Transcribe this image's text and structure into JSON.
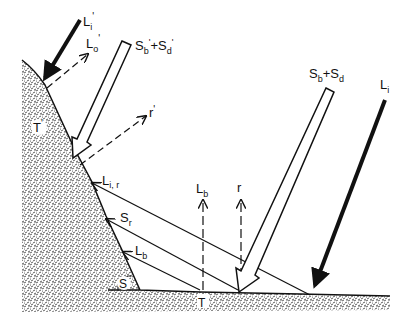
{
  "diagram": {
    "type": "radiation-balance-slope",
    "colors": {
      "ink": "#111111",
      "background": "#ffffff",
      "stipple": "#555555"
    },
    "labels": {
      "Li_prime": {
        "base": "L",
        "sub": "i",
        "prime": "'"
      },
      "Lo_prime": {
        "base": "L",
        "sub": "o",
        "prime": "'"
      },
      "Sb_Sd_prime": {
        "b1": "S",
        "s1": "b",
        "p1": "'",
        "plus": "+",
        "b2": "S",
        "s2": "d",
        "p2": "'"
      },
      "r_prime": {
        "base": "r",
        "prime": "'"
      },
      "T_prime": {
        "base": "T",
        "prime": "'"
      },
      "Lir": {
        "base": "L",
        "sub": "i, r"
      },
      "Sr": {
        "base": "S",
        "sub": "r"
      },
      "Lb_slope": {
        "base": "L",
        "sub": "b"
      },
      "Lb_up": {
        "base": "L",
        "sub": "b"
      },
      "r_up": {
        "base": "r"
      },
      "S_angle": {
        "base": "S"
      },
      "T_ground": {
        "base": "T"
      },
      "Sb_Sd": {
        "b1": "S",
        "s1": "b",
        "plus": "+",
        "b2": "S",
        "s2": "d"
      },
      "Li": {
        "base": "L",
        "sub": "i"
      }
    }
  }
}
